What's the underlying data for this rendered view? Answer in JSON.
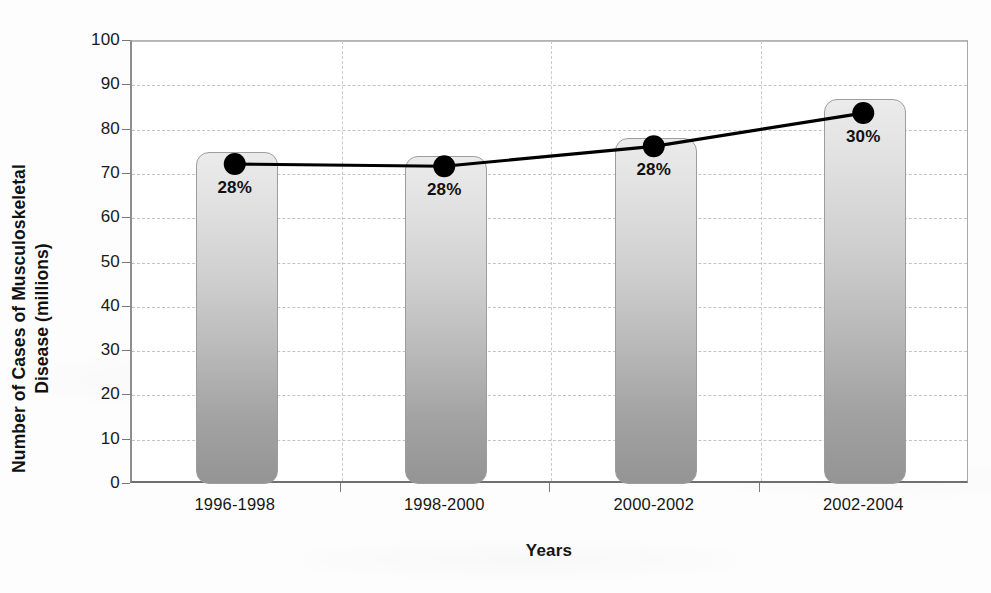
{
  "chart_data": {
    "type": "bar",
    "title": "",
    "subtitle": "",
    "xlabel": "Years",
    "ylabel_line1": "Number of Cases of Musculoskeletal",
    "ylabel_line2": "Disease (millions)",
    "ylabel": "Number of Cases of Musculoskeletal Disease (millions)",
    "categories": [
      "1996-1998",
      "1998-2000",
      "2000-2002",
      "2002-2004"
    ],
    "ylim": [
      0,
      100
    ],
    "ytick_step": 10,
    "yticks": [
      "100",
      "90",
      "80",
      "70",
      "60",
      "50",
      "40",
      "30",
      "20",
      "10",
      "0"
    ],
    "ytick_values": [
      100,
      90,
      80,
      70,
      60,
      50,
      40,
      30,
      20,
      10,
      0
    ],
    "grid": true,
    "legend": "none",
    "series": [
      {
        "name": "Number of Cases of Musculoskeletal Disease (millions)",
        "type": "bar",
        "values": [
          75,
          74,
          78,
          87
        ],
        "color": "#b9b9b9"
      },
      {
        "name": "Percent of population",
        "type": "line",
        "values": [
          72,
          71.5,
          76,
          83.5
        ],
        "labels": [
          "28%",
          "28%",
          "28%",
          "30%"
        ],
        "color": "#000000",
        "marker": "circle"
      }
    ]
  },
  "colors": {
    "bar_top": "#ebebeb",
    "bar_bottom": "#949494",
    "line": "#000000",
    "grid": "#c3c3c3",
    "axis": "#7a7a7a",
    "text": "#111111",
    "background": "#ffffff"
  }
}
